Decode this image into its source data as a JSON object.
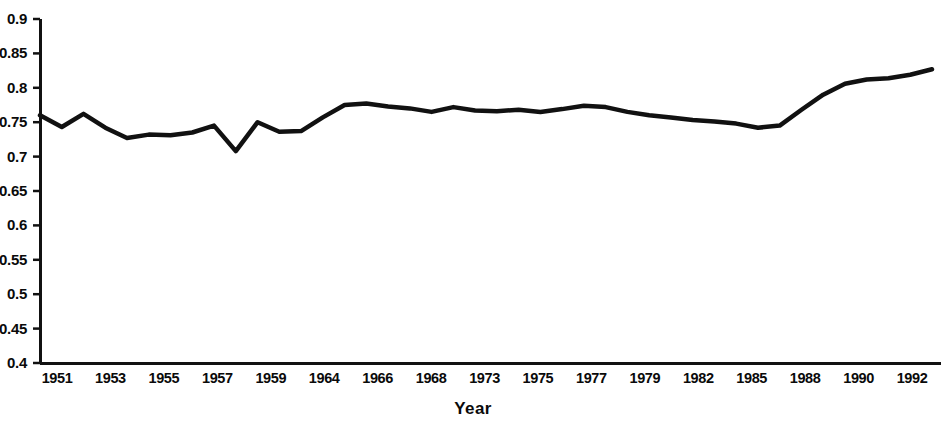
{
  "chart_data": {
    "type": "line",
    "title": "",
    "subtitle": "",
    "xlabel": "Year",
    "ylabel": "",
    "grid": false,
    "legend": null,
    "ylim": [
      0.4,
      0.9
    ],
    "ytick_labels": [
      "0.9",
      "0.85",
      "0.8",
      "0.75",
      "0.7",
      "0.65",
      "0.6",
      "0.55",
      "0.5",
      "0.45",
      "0.4"
    ],
    "ytick_values": [
      0.9,
      0.85,
      0.8,
      0.75,
      0.7,
      0.65,
      0.6,
      0.55,
      0.5,
      0.45,
      0.4
    ],
    "xtick_labels": [
      "1951",
      "1953",
      "1955",
      "1957",
      "1959",
      "1964",
      "1966",
      "1968",
      "1973",
      "1975",
      "1977",
      "1979",
      "1982",
      "1985",
      "1988",
      "1990",
      "1992"
    ],
    "x": [
      1951,
      1952,
      1953,
      1954,
      1955,
      1956,
      1957,
      1958,
      1959,
      1960,
      1961,
      1962,
      1963,
      1964,
      1965,
      1966,
      1967,
      1968,
      1969,
      1970,
      1971,
      1972,
      1973,
      1974,
      1975,
      1976,
      1977,
      1978,
      1979,
      1980,
      1981,
      1982,
      1983,
      1984,
      1985,
      1986,
      1987,
      1988,
      1989,
      1990,
      1991,
      1992
    ],
    "values": [
      0.76,
      0.743,
      0.762,
      0.742,
      0.727,
      0.732,
      0.731,
      0.735,
      0.745,
      0.708,
      0.75,
      0.736,
      0.737,
      0.757,
      0.775,
      0.777,
      0.773,
      0.77,
      0.765,
      0.772,
      0.767,
      0.766,
      0.768,
      0.765,
      0.769,
      0.774,
      0.772,
      0.765,
      0.76,
      0.757,
      0.753,
      0.751,
      0.748,
      0.742,
      0.745,
      0.768,
      0.79,
      0.806,
      0.812,
      0.814,
      0.819,
      0.827
    ],
    "series": [
      {
        "name": "series-1",
        "color": "#111111",
        "values": [
          0.76,
          0.743,
          0.762,
          0.742,
          0.727,
          0.732,
          0.731,
          0.735,
          0.745,
          0.708,
          0.75,
          0.736,
          0.737,
          0.757,
          0.775,
          0.777,
          0.773,
          0.77,
          0.765,
          0.772,
          0.767,
          0.766,
          0.768,
          0.765,
          0.769,
          0.774,
          0.772,
          0.765,
          0.76,
          0.757,
          0.753,
          0.751,
          0.748,
          0.742,
          0.745,
          0.768,
          0.79,
          0.806,
          0.812,
          0.814,
          0.819,
          0.827
        ]
      }
    ]
  },
  "axis": {
    "line_color": "#111111"
  }
}
